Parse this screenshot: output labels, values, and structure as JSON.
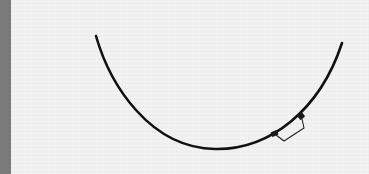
{
  "image": {
    "description": "Curved black wire with a small rectangular clasp on a light textured background",
    "subject": "curved-wire",
    "colors": {
      "background": "#f0f0f0",
      "left_strip": "#7b7b7b",
      "wire": "#111111"
    }
  }
}
